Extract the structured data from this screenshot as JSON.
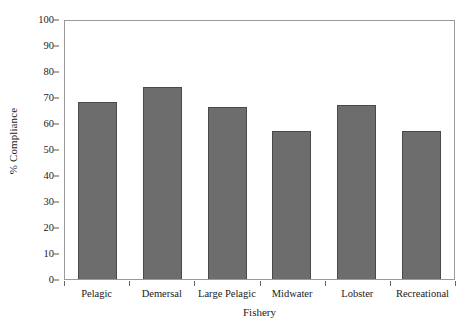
{
  "chart_data": {
    "type": "bar",
    "title": "",
    "xlabel": "Fishery",
    "ylabel": "% Compliance",
    "categories": [
      "Pelagic",
      "Demersal",
      "Large Pelagic",
      "Midwater",
      "Lobster",
      "Recreational"
    ],
    "values": [
      68,
      74,
      66,
      57,
      67,
      57
    ],
    "ylim": [
      0,
      100
    ],
    "ytick_labels": [
      "0",
      "10",
      "20",
      "30",
      "40",
      "50",
      "60",
      "70",
      "80",
      "90",
      "100"
    ],
    "ytick_values": [
      0,
      10,
      20,
      30,
      40,
      50,
      60,
      70,
      80,
      90,
      100
    ],
    "grid": false,
    "legend": "none",
    "bar_color": "#6d6d6d",
    "bar_edge_color": "#4a4a4a",
    "axis_color": "#9a9a9a",
    "background": "#ffffff"
  }
}
